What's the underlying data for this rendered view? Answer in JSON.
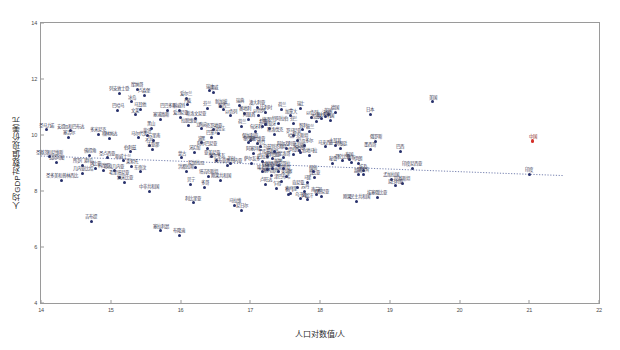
{
  "chart_data": {
    "type": "scatter",
    "title": "",
    "xlabel": "人口对数值/人",
    "ylabel": "人均GDP对数值/现价美元",
    "xlim": [
      14,
      22
    ],
    "ylim": [
      4,
      14
    ],
    "xticks": [
      14,
      15,
      16,
      17,
      18,
      19,
      20,
      21,
      22
    ],
    "yticks": [
      4,
      6,
      8,
      10,
      12,
      14
    ],
    "grid": false,
    "legend": null,
    "trendline": {
      "type": "linear-dotted",
      "x0": 14.0,
      "y0": 9.25,
      "x1": 21.5,
      "y1": 8.55,
      "color": "#3b4a8c",
      "style": "dotted"
    },
    "highlight_color": "#d4302a",
    "point_color": "#27306b",
    "points": [
      {
        "label": "圣马力诺",
        "x": 14.08,
        "y": 10.18
      },
      {
        "label": "安提瓜和巴布达",
        "x": 14.42,
        "y": 10.15
      },
      {
        "label": "塞舌尔",
        "x": 14.4,
        "y": 9.92
      },
      {
        "label": "多米尼克",
        "x": 14.82,
        "y": 10.02
      },
      {
        "label": "格林纳达",
        "x": 14.98,
        "y": 9.88
      },
      {
        "label": "圣基茨和尼维斯",
        "x": 14.12,
        "y": 9.22
      },
      {
        "label": "佛得角",
        "x": 14.7,
        "y": 9.28
      },
      {
        "label": "瓦努阿图",
        "x": 14.22,
        "y": 9.02
      },
      {
        "label": "圣卢西亚",
        "x": 14.95,
        "y": 9.18
      },
      {
        "label": "所罗门群岛",
        "x": 14.6,
        "y": 8.92
      },
      {
        "label": "冈比亚",
        "x": 14.78,
        "y": 8.8
      },
      {
        "label": "科摩罗",
        "x": 14.9,
        "y": 8.75
      },
      {
        "label": "几内亚比绍",
        "x": 14.6,
        "y": 8.62
      },
      {
        "label": "圣多美和普林西比",
        "x": 14.3,
        "y": 8.38
      },
      {
        "label": "吉布提",
        "x": 14.72,
        "y": 6.92
      },
      {
        "label": "摩纳哥",
        "x": 15.38,
        "y": 11.62
      },
      {
        "label": "列支敦士登",
        "x": 15.12,
        "y": 11.48
      },
      {
        "label": "卢森堡",
        "x": 15.48,
        "y": 11.42
      },
      {
        "label": "冰岛",
        "x": 15.3,
        "y": 11.18
      },
      {
        "label": "马耳他",
        "x": 15.42,
        "y": 10.92
      },
      {
        "label": "巴哈马",
        "x": 15.1,
        "y": 10.88
      },
      {
        "label": "文莱",
        "x": 15.35,
        "y": 10.72
      },
      {
        "label": "巴巴多斯",
        "x": 15.82,
        "y": 10.88
      },
      {
        "label": "爱沙尼亚",
        "x": 16.0,
        "y": 10.62
      },
      {
        "label": "塞浦路斯",
        "x": 15.72,
        "y": 10.55
      },
      {
        "label": "黑山",
        "x": 15.58,
        "y": 10.25
      },
      {
        "label": "斐济",
        "x": 15.52,
        "y": 9.98
      },
      {
        "label": "马尔代夫",
        "x": 15.4,
        "y": 9.9
      },
      {
        "label": "苏里南",
        "x": 15.62,
        "y": 9.82
      },
      {
        "label": "不丹",
        "x": 15.55,
        "y": 9.62
      },
      {
        "label": "圭亚那",
        "x": 15.6,
        "y": 9.48
      },
      {
        "label": "伯利兹",
        "x": 15.28,
        "y": 9.4
      },
      {
        "label": "斯威士兰",
        "x": 15.18,
        "y": 9.08
      },
      {
        "label": "莱索托",
        "x": 15.3,
        "y": 8.88
      },
      {
        "label": "赤道几内亚",
        "x": 15.05,
        "y": 8.72
      },
      {
        "label": "东帝汶",
        "x": 15.42,
        "y": 8.68
      },
      {
        "label": "毛里塔尼亚",
        "x": 15.12,
        "y": 8.48
      },
      {
        "label": "纳米比亚",
        "x": 15.2,
        "y": 8.3
      },
      {
        "label": "中非共和国",
        "x": 15.55,
        "y": 7.98
      },
      {
        "label": "布隆迪",
        "x": 15.98,
        "y": 6.42
      },
      {
        "label": "塞拉利昂",
        "x": 15.72,
        "y": 6.58
      },
      {
        "label": "挪威",
        "x": 16.48,
        "y": 11.52
      },
      {
        "label": "瑞士",
        "x": 16.42,
        "y": 11.58
      },
      {
        "label": "爱尔兰",
        "x": 16.08,
        "y": 11.32
      },
      {
        "label": "丹麦",
        "x": 16.1,
        "y": 11.08
      },
      {
        "label": "新加坡",
        "x": 16.58,
        "y": 11.02
      },
      {
        "label": "芬兰",
        "x": 16.38,
        "y": 10.95
      },
      {
        "label": "新西兰",
        "x": 16.62,
        "y": 10.9
      },
      {
        "label": "瑞典",
        "x": 16.85,
        "y": 11.05
      },
      {
        "label": "奥地利",
        "x": 16.92,
        "y": 10.78
      },
      {
        "label": "以色列",
        "x": 16.72,
        "y": 10.68
      },
      {
        "label": "科威特",
        "x": 15.98,
        "y": 10.88
      },
      {
        "label": "斯洛文尼亚",
        "x": 16.22,
        "y": 10.6
      },
      {
        "label": "拉脱维亚",
        "x": 16.12,
        "y": 10.35
      },
      {
        "label": "立陶宛",
        "x": 16.3,
        "y": 10.22
      },
      {
        "label": "克罗地亚",
        "x": 16.48,
        "y": 10.18
      },
      {
        "label": "乌拉圭",
        "x": 16.55,
        "y": 10.05
      },
      {
        "label": "巴拿马",
        "x": 16.45,
        "y": 9.92
      },
      {
        "label": "波黑",
        "x": 16.3,
        "y": 9.72
      },
      {
        "label": "阿尔巴尼亚",
        "x": 16.38,
        "y": 9.52
      },
      {
        "label": "牙买加",
        "x": 16.2,
        "y": 9.38
      },
      {
        "label": "蒙古",
        "x": 16.02,
        "y": 9.18
      },
      {
        "label": "亚美尼亚",
        "x": 16.45,
        "y": 9.22
      },
      {
        "label": "摩尔多瓦",
        "x": 16.52,
        "y": 9.1
      },
      {
        "label": "巴布亚新几内亚",
        "x": 16.68,
        "y": 8.92
      },
      {
        "label": "老挝",
        "x": 16.72,
        "y": 9.0
      },
      {
        "label": "尼加拉瓜",
        "x": 16.22,
        "y": 8.85
      },
      {
        "label": "洪都拉斯",
        "x": 16.08,
        "y": 8.7
      },
      {
        "label": "塔吉克斯坦",
        "x": 16.4,
        "y": 8.52
      },
      {
        "label": "刚果共和国",
        "x": 16.58,
        "y": 8.38
      },
      {
        "label": "贝宁",
        "x": 16.15,
        "y": 8.25
      },
      {
        "label": "多哥",
        "x": 16.35,
        "y": 8.12
      },
      {
        "label": "利比里亚",
        "x": 16.18,
        "y": 7.58
      },
      {
        "label": "马拉维",
        "x": 16.78,
        "y": 7.48
      },
      {
        "label": "尼日尔",
        "x": 16.88,
        "y": 7.32
      },
      {
        "label": "比利时",
        "x": 17.22,
        "y": 10.82
      },
      {
        "label": "荷兰",
        "x": 17.45,
        "y": 10.92
      },
      {
        "label": "以色列",
        "x": 17.12,
        "y": 10.7
      },
      {
        "label": "葡萄牙",
        "x": 17.28,
        "y": 10.25
      },
      {
        "label": "希腊",
        "x": 17.18,
        "y": 10.32
      },
      {
        "label": "捷克",
        "x": 17.22,
        "y": 10.38
      },
      {
        "label": "匈牙利",
        "x": 17.08,
        "y": 10.12
      },
      {
        "label": "斯洛伐克",
        "x": 17.35,
        "y": 10.02
      },
      {
        "label": "保加利亚",
        "x": 17.0,
        "y": 9.82
      },
      {
        "label": "塞尔维亚",
        "x": 17.1,
        "y": 9.7
      },
      {
        "label": "约旦",
        "x": 17.15,
        "y": 9.58
      },
      {
        "label": "黎巴嫩",
        "x": 16.98,
        "y": 9.72
      },
      {
        "label": "阿塞拜疆",
        "x": 17.05,
        "y": 9.35
      },
      {
        "label": "土库曼斯坦",
        "x": 17.25,
        "y": 9.25
      },
      {
        "label": "玻利维亚",
        "x": 17.32,
        "y": 9.15
      },
      {
        "label": "巴拉圭",
        "x": 17.18,
        "y": 9.05
      },
      {
        "label": "萨尔瓦多",
        "x": 17.02,
        "y": 8.98
      },
      {
        "label": "吉尔吉斯斯坦",
        "x": 17.4,
        "y": 8.68
      },
      {
        "label": "柬埔寨",
        "x": 17.52,
        "y": 8.52
      },
      {
        "label": "塞内加尔",
        "x": 17.3,
        "y": 8.55
      },
      {
        "label": "津巴布韦",
        "x": 17.45,
        "y": 8.35
      },
      {
        "label": "卢旺达",
        "x": 17.22,
        "y": 8.25
      },
      {
        "label": "乍得",
        "x": 17.38,
        "y": 8.1
      },
      {
        "label": "索马里",
        "x": 17.58,
        "y": 7.92
      },
      {
        "label": "瑞士",
        "x": 17.72,
        "y": 10.95
      },
      {
        "label": "以色列",
        "x": 17.88,
        "y": 10.62
      },
      {
        "label": "芬兰",
        "x": 17.62,
        "y": 10.42
      },
      {
        "label": "智利",
        "x": 17.75,
        "y": 10.18
      },
      {
        "label": "罗马尼亚",
        "x": 17.62,
        "y": 9.98
      },
      {
        "label": "哈萨克斯坦",
        "x": 17.68,
        "y": 9.82
      },
      {
        "label": "厄瓜多尔",
        "x": 17.78,
        "y": 9.62
      },
      {
        "label": "突尼斯",
        "x": 17.7,
        "y": 9.45
      },
      {
        "label": "危地马拉",
        "x": 17.85,
        "y": 9.28
      },
      {
        "label": "赞比亚",
        "x": 17.92,
        "y": 8.48
      },
      {
        "label": "马里",
        "x": 17.82,
        "y": 8.32
      },
      {
        "label": "南苏丹",
        "x": 17.95,
        "y": 7.88
      },
      {
        "label": "澳大利亚",
        "x": 17.1,
        "y": 11.0
      },
      {
        "label": "阿联酋",
        "x": 16.98,
        "y": 10.55
      },
      {
        "label": "沙特阿拉伯",
        "x": 17.4,
        "y": 10.42
      },
      {
        "label": "荷兰",
        "x": 16.88,
        "y": 10.3
      },
      {
        "label": "美国",
        "x": 19.62,
        "y": 11.18
      },
      {
        "label": "日本",
        "x": 18.72,
        "y": 10.75
      },
      {
        "label": "德国",
        "x": 18.22,
        "y": 10.82
      },
      {
        "label": "英国",
        "x": 18.12,
        "y": 10.72
      },
      {
        "label": "法国",
        "x": 18.08,
        "y": 10.65
      },
      {
        "label": "意大利",
        "x": 18.02,
        "y": 10.58
      },
      {
        "label": "韩国",
        "x": 18.15,
        "y": 10.52
      },
      {
        "label": "西班牙",
        "x": 17.95,
        "y": 10.48
      },
      {
        "label": "加拿大",
        "x": 17.58,
        "y": 10.68
      },
      {
        "label": "波兰",
        "x": 17.85,
        "y": 10.12
      },
      {
        "label": "土耳其",
        "x": 18.22,
        "y": 9.62
      },
      {
        "label": "俄罗斯",
        "x": 18.8,
        "y": 9.78
      },
      {
        "label": "墨西哥",
        "x": 18.72,
        "y": 9.48
      },
      {
        "label": "巴西",
        "x": 19.15,
        "y": 9.42
      },
      {
        "label": "阿根廷",
        "x": 18.3,
        "y": 9.52
      },
      {
        "label": "马来西亚",
        "x": 18.08,
        "y": 9.58
      },
      {
        "label": "泰国",
        "x": 18.42,
        "y": 9.12
      },
      {
        "label": "南非",
        "x": 18.45,
        "y": 9.02
      },
      {
        "label": "哥伦比亚",
        "x": 18.32,
        "y": 9.08
      },
      {
        "label": "秘鲁",
        "x": 18.18,
        "y": 9.0
      },
      {
        "label": "伊朗",
        "x": 18.55,
        "y": 8.98
      },
      {
        "label": "埃及",
        "x": 18.62,
        "y": 8.72
      },
      {
        "label": "越南",
        "x": 18.55,
        "y": 8.58
      },
      {
        "label": "菲律宾",
        "x": 18.62,
        "y": 8.6
      },
      {
        "label": "印度尼西亚",
        "x": 19.32,
        "y": 8.82
      },
      {
        "label": "孟加拉国",
        "x": 19.02,
        "y": 8.42
      },
      {
        "label": "巴基斯坦",
        "x": 19.18,
        "y": 8.28
      },
      {
        "label": "尼日利亚",
        "x": 19.08,
        "y": 8.18
      },
      {
        "label": "埃塞俄比亚",
        "x": 18.82,
        "y": 7.78
      },
      {
        "label": "刚果民主共和国",
        "x": 18.52,
        "y": 7.62
      },
      {
        "label": "坦桑尼亚",
        "x": 18.02,
        "y": 7.82
      },
      {
        "label": "肯尼亚",
        "x": 17.68,
        "y": 8.12
      },
      {
        "label": "苏丹",
        "x": 17.78,
        "y": 7.98
      },
      {
        "label": "乌干达",
        "x": 17.72,
        "y": 7.72
      },
      {
        "label": "缅甸",
        "x": 17.9,
        "y": 8.68
      },
      {
        "label": "乌克兰",
        "x": 17.72,
        "y": 9.38
      },
      {
        "label": "伊拉克",
        "x": 17.62,
        "y": 9.32
      },
      {
        "label": "摩洛哥",
        "x": 17.48,
        "y": 9.18
      },
      {
        "label": "乌兹别克斯坦",
        "x": 17.35,
        "y": 9.42
      },
      {
        "label": "阿尔及利亚",
        "x": 17.52,
        "y": 9.52
      },
      {
        "label": "阿富汗",
        "x": 17.82,
        "y": 7.68
      },
      {
        "label": "也门",
        "x": 17.55,
        "y": 7.88
      },
      {
        "label": "叙利亚",
        "x": 17.25,
        "y": 8.78
      },
      {
        "label": "安哥拉",
        "x": 17.48,
        "y": 8.82
      },
      {
        "label": "加纳",
        "x": 17.4,
        "y": 8.92
      },
      {
        "label": "科特迪瓦",
        "x": 17.32,
        "y": 8.82
      },
      {
        "label": "喀麦隆",
        "x": 17.18,
        "y": 8.68
      },
      {
        "label": "中国",
        "x": 21.05,
        "y": 9.78,
        "highlight": true
      },
      {
        "label": "印度",
        "x": 21.0,
        "y": 8.6
      }
    ]
  }
}
